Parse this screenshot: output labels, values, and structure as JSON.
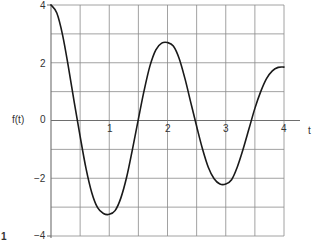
{
  "chart_data": {
    "type": "line",
    "title": "",
    "xlabel": "t",
    "ylabel": "f(t)",
    "xlim": [
      0,
      4
    ],
    "ylim": [
      -4,
      4
    ],
    "x_ticks": [
      1,
      2,
      3,
      4
    ],
    "y_ticks": [
      4,
      2,
      0,
      -2,
      -4
    ],
    "x_tick_labels": [
      "1",
      "2",
      "3",
      "4"
    ],
    "y_tick_labels": [
      "4",
      "2",
      "0",
      "−2",
      "−4"
    ],
    "grid": true,
    "grid_x_step": 0.5,
    "grid_y_step": 1,
    "legend": null,
    "series": [
      {
        "name": "f(t)",
        "x": [
          0,
          0.1,
          0.2,
          0.3,
          0.4,
          0.5,
          0.6,
          0.7,
          0.8,
          0.9,
          1.0,
          1.1,
          1.2,
          1.3,
          1.4,
          1.5,
          1.6,
          1.7,
          1.8,
          1.9,
          2.0,
          2.1,
          2.2,
          2.3,
          2.4,
          2.5,
          2.6,
          2.7,
          2.8,
          2.9,
          3.0,
          3.1,
          3.2,
          3.3,
          3.4,
          3.5,
          3.6,
          3.7,
          3.8,
          3.9,
          4.0
        ],
        "values": [
          4.0,
          3.72,
          2.95,
          1.84,
          0.62,
          -0.55,
          -1.65,
          -2.5,
          -3.02,
          -3.22,
          -3.25,
          -3.12,
          -2.68,
          -1.95,
          -0.98,
          0.05,
          1.05,
          1.9,
          2.45,
          2.68,
          2.7,
          2.58,
          2.15,
          1.45,
          0.62,
          -0.2,
          -0.98,
          -1.62,
          -2.02,
          -2.2,
          -2.2,
          -2.05,
          -1.6,
          -0.98,
          -0.28,
          0.42,
          1.0,
          1.45,
          1.72,
          1.84,
          1.85
        ]
      }
    ],
    "annotations": [
      "1"
    ]
  },
  "labels": {
    "ylabel": "f(t)",
    "xlabel": "t",
    "y_tick_4": "4",
    "y_tick_2": "2",
    "y_tick_0": "0",
    "y_tick_m2": "−2",
    "y_tick_m4": "−4",
    "x_tick_1": "1",
    "x_tick_2": "2",
    "x_tick_3": "3",
    "x_tick_4": "4",
    "corner_mark": "1"
  },
  "colors": {
    "grid": "#8a8a8a",
    "axis": "#6e6e6e",
    "curve": "#1a1a1a",
    "background": "#ffffff"
  }
}
